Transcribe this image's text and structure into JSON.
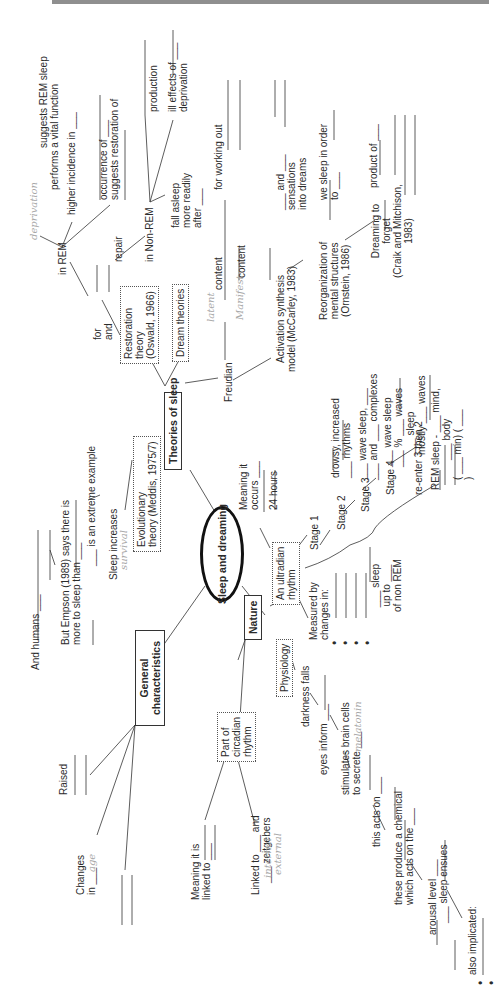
{
  "central": "Sleep and dreaming",
  "branches": {
    "theories": "Theories of sleep",
    "general": "General characteristics",
    "nature": "Nature"
  },
  "theories": {
    "restoration_box": [
      "Restoration",
      "theory",
      "(Oswald, 1966)"
    ],
    "evolutionary_box": [
      "Evolutionary",
      "theory (Meddis, 1975/7)"
    ],
    "dream_box": "Dream theories",
    "for_and": [
      "for",
      "and"
    ],
    "repair": "repair",
    "in_rem": "in REM",
    "in_nonrem": "in Non-REM",
    "rem_items": {
      "vital": [
        "suggests REM sleep",
        "performs a vital function"
      ],
      "vital_answer": "deprivation",
      "higher": "higher incidence in ___",
      "occurrence": [
        "occurrence of ___",
        "suggests restoration of"
      ]
    },
    "nonrem_items": {
      "production": "production",
      "ill_effects": [
        "ill effects of ___",
        "deprivation"
      ],
      "fall_asleep": [
        "fall asleep",
        "more readily",
        "after ___"
      ]
    },
    "freudian": "Freudian",
    "latent": "content",
    "latent_answer": "latent",
    "manifest": "content",
    "manifest_answer": "Manifest",
    "for_working_out": "for working out",
    "activation": [
      "Activation synthesis",
      "model (McCarley, 1983)"
    ],
    "and_sensations": [
      "___ and ___",
      "sensations",
      "into dreams"
    ],
    "reorganization": [
      "Reorganization of",
      "mental structures",
      "(Ornstein, 1986)"
    ],
    "sleep_in_order": [
      "we sleep in order",
      "to ___"
    ],
    "dreaming_forget": [
      "Dreaming to",
      "forget",
      "(Craik and Mitchison,",
      "1983)"
    ],
    "product_of": "product of ___",
    "evolutionary_items": {
      "and_humans": "And humans ___",
      "empson": [
        "But Empson (1989) says there is",
        "more to sleep than ___"
      ],
      "extreme": "___ is an extreme example",
      "sleep_increases": "Sleep increases",
      "survival_answer": "survival"
    }
  },
  "general": {
    "raised": "Raised",
    "changes_in": [
      "Changes",
      "in ___"
    ],
    "changes_answer": "age"
  },
  "nature": {
    "ultradian_box": [
      "An ultradian",
      "rhythm"
    ],
    "meaning_occurs": [
      "Meaning it",
      "occurs ___"
    ],
    "hours": "24 hours",
    "measured_by": [
      "Measured by",
      "changes in:"
    ],
    "bullets": 4,
    "stages": [
      {
        "label": "Stage 1",
        "desc": [
          "drowsy, increased",
          "___ rhythms"
        ]
      },
      {
        "label": "Stage 2",
        "desc": [
          "___ wave sleep, ___",
          "___ and ___ complexes"
        ],
        "answers": [
          "sleep",
          "spindles",
          "k"
        ]
      },
      {
        "label": "Stage 3",
        "desc": [
          "___ wave sleep",
          "___ % ___ waves"
        ],
        "answers": [
          "delta",
          "50",
          "delta"
        ]
      },
      {
        "label": "Stage 4",
        "desc": [
          "___ sleep",
          "mostly ___ waves"
        ],
        "answers": [
          "deep",
          "delta"
        ]
      }
    ],
    "reenter": "re-enter 3 then 2",
    "rem_sleep": [
      "REM sleep - ___ mind,",
      "___ body",
      "( ___ min) ( ___",
      ")"
    ],
    "sleep_upto": [
      "___ sleep",
      "up to ___",
      "of non REM"
    ],
    "circadian_box": [
      "Part of",
      "circadian",
      "rhythm"
    ],
    "meaning_linked": [
      "Meaning it is",
      "linked to ___"
    ],
    "linked_to": [
      "Linked to ___ and",
      "___ zeitgebers"
    ],
    "linked_answers": [
      "internal",
      "external"
    ],
    "physiology_box": "Physiology",
    "darkness": "darkness falls",
    "eyes_inform": "eyes inform ___",
    "stimulates": [
      "stimulates brain cells",
      "to secrete ___"
    ],
    "secrete_answer": "melatonin",
    "acts_on": "this acts on ___",
    "produce_chemical": [
      "these produce a chemical",
      "which acts on the ___"
    ],
    "arousal": [
      "arousal level ___",
      "___ sleep ensues"
    ],
    "also_implicated": "also implicated:"
  }
}
